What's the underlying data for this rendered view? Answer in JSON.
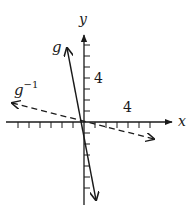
{
  "axes": {
    "x_label": "x",
    "y_label": "y",
    "x_tick_label": "4",
    "y_tick_label": "4",
    "origin_px": [
      84,
      122
    ],
    "unit_px": 11,
    "x_ticks_range": [
      -6,
      6
    ],
    "y_ticks_range": [
      -7,
      7
    ]
  },
  "curves": [
    {
      "name": "g",
      "label": "g",
      "style": "solid",
      "description": "steep line through origin, slope about -5"
    },
    {
      "name": "g_inverse",
      "label_base": "g",
      "label_sup": "−1",
      "style": "dashed",
      "description": "shallow line through origin, slope about -1/5"
    }
  ],
  "colors": {
    "ink": "#1a1a1a",
    "background": "#ffffff"
  }
}
